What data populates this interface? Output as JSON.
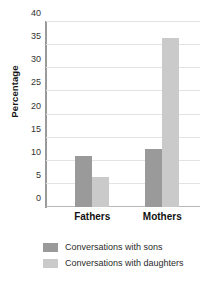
{
  "chart_data": {
    "type": "bar",
    "title": "",
    "xlabel": "",
    "ylabel": "Percentage",
    "ylim": [
      0,
      40
    ],
    "yticks": [
      40,
      35,
      30,
      25,
      20,
      15,
      10,
      5,
      0
    ],
    "grid": true,
    "legend_position": "bottom-left",
    "categories": [
      "Fathers",
      "Mothers"
    ],
    "series": [
      {
        "name": "Conversations with sons",
        "color": "#9a9a9a",
        "values": [
          11,
          12.5
        ]
      },
      {
        "name": "Conversations with daughters",
        "color": "#cacaca",
        "values": [
          6.5,
          36.5
        ]
      }
    ]
  },
  "axis": {
    "y_title": "Percentage"
  },
  "colors": {
    "sons": "#9a9a9a",
    "daughters": "#cacaca",
    "gridline": "#e3e3e3",
    "axis": "#9a9a9a",
    "background": "#ffffff"
  }
}
